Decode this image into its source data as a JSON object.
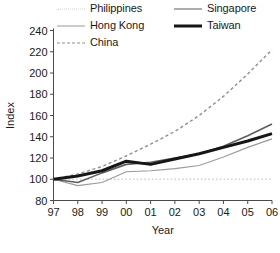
{
  "chart_data": {
    "type": "line",
    "title": "",
    "xlabel": "Year",
    "ylabel": "Index",
    "categories": [
      "97",
      "98",
      "99",
      "00",
      "01",
      "02",
      "03",
      "04",
      "05",
      "06"
    ],
    "x": [
      1997,
      1998,
      1999,
      2000,
      2001,
      2002,
      2003,
      2004,
      2005,
      2006
    ],
    "xlim": [
      1997,
      2006
    ],
    "ylim": [
      80,
      240
    ],
    "yticks": [
      80,
      100,
      120,
      140,
      160,
      180,
      200,
      220,
      240
    ],
    "xticks": [
      "97",
      "98",
      "99",
      "00",
      "01",
      "02",
      "03",
      "04",
      "05",
      "06"
    ],
    "grid": false,
    "legend_position": "top",
    "series": [
      {
        "name": "Philippines",
        "color": "#cfcfcf",
        "style": "dotted",
        "width": 1.4,
        "values": [
          100,
          100,
          100,
          100,
          100,
          100,
          100,
          100,
          100,
          100
        ]
      },
      {
        "name": "Singapore",
        "color": "#5d5d5d",
        "style": "solid",
        "width": 1.6,
        "values": [
          100,
          97,
          106,
          114,
          116,
          120,
          124,
          131,
          141,
          152
        ]
      },
      {
        "name": "Hong Kong",
        "color": "#9a9a9a",
        "style": "solid",
        "width": 1.1,
        "values": [
          100,
          94,
          97,
          107,
          108,
          110,
          113,
          121,
          130,
          138
        ]
      },
      {
        "name": "Taiwan",
        "color": "#161616",
        "style": "solid",
        "width": 3.0,
        "values": [
          100,
          103,
          108,
          117,
          114,
          119,
          124,
          130,
          136,
          143
        ]
      },
      {
        "name": "China",
        "color": "#8e8e8e",
        "style": "dashed",
        "width": 1.4,
        "values": [
          100,
          105,
          112,
          122,
          133,
          145,
          160,
          178,
          199,
          222
        ]
      }
    ]
  },
  "legend": {
    "items": [
      {
        "label": "Philippines"
      },
      {
        "label": "Singapore"
      },
      {
        "label": "Hong Kong"
      },
      {
        "label": "Taiwan"
      },
      {
        "label": "China"
      }
    ]
  },
  "axes": {
    "y_title": "Index",
    "x_title": "Year",
    "y_labels": [
      "240",
      "220",
      "200",
      "180",
      "160",
      "140",
      "120",
      "100",
      "80"
    ],
    "x_labels": [
      "97",
      "98",
      "99",
      "00",
      "01",
      "02",
      "03",
      "04",
      "05",
      "06"
    ]
  }
}
